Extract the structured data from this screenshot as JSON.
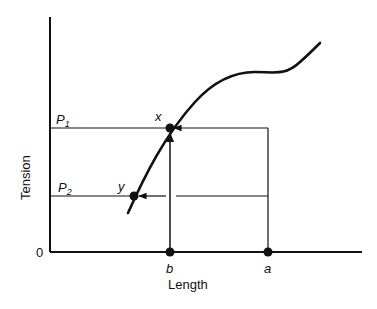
{
  "diagram": {
    "y_axis_label": "Tension",
    "x_axis_label": "Length",
    "origin_label": "0",
    "tension_levels": [
      {
        "label": "P",
        "subscript": "1"
      },
      {
        "label": "P",
        "subscript": "2"
      }
    ],
    "points": {
      "x": "x",
      "y": "y"
    },
    "length_marks": {
      "b": "b",
      "a": "a"
    }
  },
  "colors": {
    "ink": "#111111",
    "background": "#ffffff"
  }
}
